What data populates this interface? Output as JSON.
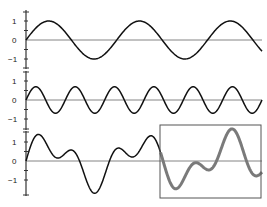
{
  "chart_data": [
    {
      "type": "line",
      "title": "",
      "xlabel": "",
      "ylabel": "",
      "yticks": [
        "1",
        "0",
        "−1"
      ],
      "ylim": [
        -1.5,
        1.5
      ],
      "description": "Low-frequency sine wave, amplitude 1, ~2.6 cycles",
      "series": [
        {
          "name": "sine_low",
          "amplitude": 1.0,
          "cycles": 2.6,
          "color": "#111111"
        }
      ]
    },
    {
      "type": "line",
      "title": "",
      "xlabel": "",
      "ylabel": "",
      "yticks": [
        "1",
        "0",
        "−1"
      ],
      "ylim": [
        -1.5,
        1.5
      ],
      "description": "Higher-frequency sine wave, amplitude ~0.7, ~6 cycles",
      "series": [
        {
          "name": "sine_high",
          "amplitude": 0.7,
          "cycles": 6.0,
          "color": "#111111"
        }
      ]
    },
    {
      "type": "line",
      "title": "",
      "xlabel": "",
      "ylabel": "",
      "yticks": [
        "1",
        "0",
        "−1"
      ],
      "ylim": [
        -1.5,
        1.5
      ],
      "description": "Sum of the two sine waves; highlighted segment on the right inside a rectangle drawn in thick gray",
      "series": [
        {
          "name": "sum",
          "components": [
            "sine_low",
            "sine_high"
          ],
          "color": "#111111"
        },
        {
          "name": "highlighted_segment",
          "x_range_fraction": [
            0.57,
            1.0
          ],
          "color": "#7a7a7a"
        }
      ],
      "annotations": [
        {
          "type": "rectangle",
          "label": "",
          "color": "#555555"
        }
      ]
    }
  ],
  "panels": [
    {
      "tick_labels": [
        "1",
        "0",
        "−1"
      ]
    },
    {
      "tick_labels": [
        "1",
        "0",
        "−1"
      ]
    },
    {
      "tick_labels": [
        "1",
        "0",
        "−1"
      ]
    }
  ],
  "colors": {
    "curve": "#111111",
    "highlight": "#7a7a7a",
    "axis": "#333333",
    "zero_line": "#666666",
    "box": "#555555"
  }
}
